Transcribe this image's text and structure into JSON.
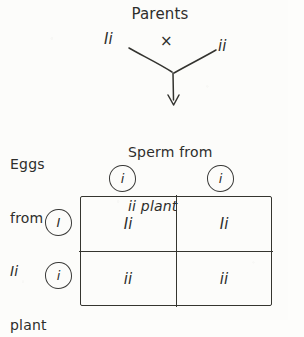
{
  "diagram": {
    "title": "Parents",
    "cross_symbol": "×",
    "parent_left_genotype": "Ii",
    "parent_right_genotype": "ii",
    "sperm_label_line1": "Sperm from",
    "sperm_label_line2": "ii plant",
    "eggs_label_line1": "Eggs",
    "eggs_label_line2": "from",
    "eggs_label_line3": "Ii",
    "eggs_label_line4": "plant",
    "ink_color": "#2e2e2c",
    "paper_color": "#fcfcfa"
  },
  "punnett": {
    "column_gametes": [
      "i",
      "i"
    ],
    "row_gametes": [
      "I",
      "i"
    ],
    "cells": [
      [
        "Ii",
        "Ii"
      ],
      [
        "ii",
        "ii"
      ]
    ]
  }
}
